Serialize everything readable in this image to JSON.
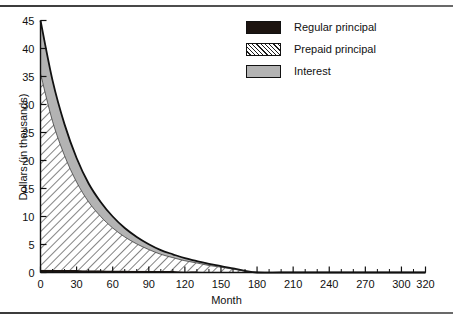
{
  "chart_data": {
    "type": "area",
    "title": "",
    "xlabel": "Month",
    "ylabel": "Dollars (in thousands)",
    "xlim": [
      0,
      320
    ],
    "ylim": [
      0,
      45
    ],
    "grid": false,
    "stacked": true,
    "legend_position": "top-right",
    "x_ticks": [
      0,
      30,
      60,
      90,
      120,
      150,
      180,
      210,
      240,
      270,
      300,
      320
    ],
    "x_tick_labels": [
      "0",
      "30",
      "60",
      "90",
      "120",
      "150",
      "180",
      "210",
      "240",
      "270",
      "300",
      "320"
    ],
    "x_minor_tick_interval": 10,
    "y_ticks": [
      0,
      5,
      10,
      15,
      20,
      25,
      30,
      35,
      40,
      45
    ],
    "y_tick_labels": [
      "0",
      "5",
      "10",
      "15",
      "20",
      "25",
      "30",
      "35",
      "40",
      "45"
    ],
    "legend": [
      "Regular principal",
      "Prepaid principal",
      "Interest"
    ],
    "series": [
      {
        "name": "Regular principal",
        "fill": "solid-black",
        "color": "#1c1410",
        "x": [
          0,
          10,
          20,
          30,
          40,
          50,
          60,
          70,
          80,
          90,
          100,
          110,
          120,
          130,
          140,
          150,
          160,
          170,
          180,
          200,
          220,
          240,
          260,
          280,
          300,
          320
        ],
        "values": [
          0.5,
          0.5,
          0.45,
          0.45,
          0.4,
          0.4,
          0.35,
          0.35,
          0.3,
          0.3,
          0.25,
          0.25,
          0.2,
          0.2,
          0.15,
          0.15,
          0.1,
          0.05,
          0,
          0,
          0,
          0,
          0,
          0,
          0,
          0
        ]
      },
      {
        "name": "Prepaid principal",
        "fill": "diagonal-hatch",
        "color": "#ffffff",
        "x": [
          0,
          10,
          20,
          30,
          40,
          50,
          60,
          70,
          80,
          90,
          100,
          110,
          120,
          130,
          140,
          150,
          160,
          170,
          180,
          200,
          220,
          240,
          260,
          280,
          300,
          320
        ],
        "values": [
          35.0,
          26.5,
          20.4,
          15.7,
          12.2,
          9.6,
          7.6,
          6.0,
          4.8,
          3.8,
          3.0,
          2.4,
          1.9,
          1.5,
          1.1,
          0.8,
          0.5,
          0.2,
          0.0,
          0,
          0,
          0,
          0,
          0,
          0,
          0
        ]
      },
      {
        "name": "Interest",
        "fill": "gray",
        "color": "#b3b3b3",
        "x": [
          0,
          10,
          20,
          30,
          40,
          50,
          60,
          70,
          80,
          90,
          100,
          110,
          120,
          130,
          140,
          150,
          160,
          170,
          180,
          200,
          220,
          240,
          260,
          280,
          300,
          320
        ],
        "values": [
          9.5,
          7.3,
          5.6,
          4.3,
          3.3,
          2.6,
          2.0,
          1.6,
          1.25,
          0.95,
          0.75,
          0.6,
          0.45,
          0.35,
          0.28,
          0.2,
          0.12,
          0.05,
          0.0,
          0,
          0,
          0,
          0,
          0,
          0,
          0
        ]
      }
    ],
    "total": {
      "name": "Total payment",
      "x": [
        0,
        10,
        20,
        30,
        40,
        50,
        60,
        70,
        80,
        90,
        100,
        110,
        120,
        130,
        140,
        150,
        160,
        170,
        180,
        200,
        220,
        240,
        260,
        280,
        300,
        320
      ],
      "values": [
        45.0,
        34.3,
        26.45,
        20.45,
        15.9,
        12.6,
        10.0,
        7.95,
        6.35,
        5.05,
        4.0,
        3.25,
        2.55,
        2.05,
        1.53,
        1.15,
        0.72,
        0.3,
        0.0,
        0,
        0,
        0,
        0,
        0,
        0,
        0
      ]
    }
  },
  "legend": {
    "items": [
      {
        "label": "Regular principal"
      },
      {
        "label": "Prepaid principal"
      },
      {
        "label": "Interest"
      }
    ]
  },
  "axes": {
    "x_title": "Month",
    "y_title": "Dollars (in thousands)"
  }
}
